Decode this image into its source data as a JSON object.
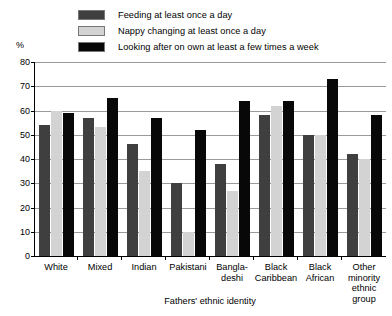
{
  "chart_data": {
    "type": "bar",
    "title": "",
    "xlabel": "Fathers' ethnic identity",
    "ylabel": "%",
    "ylim": [
      0,
      80
    ],
    "yticks": [
      0,
      10,
      20,
      30,
      40,
      50,
      60,
      70,
      80
    ],
    "grid": true,
    "legend_position": "top",
    "categories": [
      "White",
      "Mixed",
      "Indian",
      "Bangla-deshi",
      "Pakistani",
      "Black Caribbean",
      "Black African",
      "Other minority ethnic group"
    ],
    "category_lines": [
      [
        "White"
      ],
      [
        "Mixed"
      ],
      [
        "Indian"
      ],
      [
        "Pakistani"
      ],
      [
        "Bangla-",
        "deshi"
      ],
      [
        "Black",
        "Caribbean"
      ],
      [
        "Black",
        "African"
      ],
      [
        "Other",
        "minority",
        "ethnic group"
      ]
    ],
    "series": [
      {
        "name": "Feeding at least once a day",
        "color": "#3f3f3f",
        "values": [
          54,
          57,
          46,
          30,
          38,
          58,
          50,
          42
        ]
      },
      {
        "name": "Nappy changing at least once a day",
        "color": "#d3d3d3",
        "values": [
          60,
          53,
          35,
          10,
          27,
          62,
          50,
          40
        ]
      },
      {
        "name": "Looking after on own at least a few times a week",
        "color": "#080808",
        "values": [
          59,
          65,
          57,
          52,
          64,
          64,
          73,
          58
        ]
      }
    ]
  }
}
